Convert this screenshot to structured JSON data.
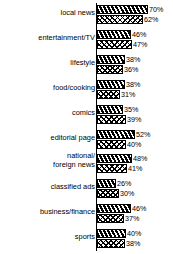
{
  "chart_data": {
    "type": "bar",
    "orientation": "horizontal",
    "title": "",
    "subtitle": "",
    "xlabel": "",
    "ylabel": "",
    "xlim": [
      0,
      70
    ],
    "grid": false,
    "legend_position": "none",
    "value_suffix": "%",
    "categories": [
      "local news",
      "entertainment/TV",
      "lifestyle",
      "food/cooking",
      "comics",
      "editorial page",
      "national/\nforeign news",
      "classified ads",
      "business/finance",
      "sports"
    ],
    "series": [
      {
        "name": "series-1",
        "pattern": "black-diagonal-hatch",
        "values": [
          70,
          46,
          38,
          38,
          35,
          52,
          48,
          26,
          46,
          40
        ],
        "labels": [
          "70%",
          "46%",
          "38%",
          "38%",
          "35%",
          "52%",
          "48%",
          "26%",
          "46%",
          "40%"
        ]
      },
      {
        "name": "series-2",
        "pattern": "white-diamond-hatch",
        "values": [
          62,
          47,
          36,
          31,
          39,
          40,
          41,
          30,
          37,
          38
        ],
        "labels": [
          "62%",
          "47%",
          "36%",
          "31%",
          "39%",
          "40%",
          "41%",
          "30%",
          "37%",
          "38%"
        ]
      }
    ]
  },
  "colors": {
    "axis": "#000000",
    "bar_dark": "#000000",
    "bar_light": "#ffffff",
    "background": "#ffffff",
    "text": "#000000"
  }
}
